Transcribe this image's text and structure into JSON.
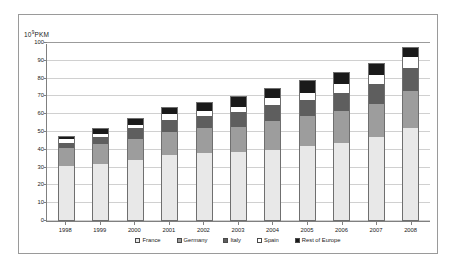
{
  "chart_data": {
    "type": "bar",
    "stacked": true,
    "title": "",
    "subtitle": "",
    "xlabel": "",
    "ylabel": "10⁹PKM",
    "ylabel_base": "10",
    "ylabel_exp": "9",
    "ylabel_unit": "PKM",
    "categories": [
      "1998",
      "1999",
      "2000",
      "2001",
      "2002",
      "2003",
      "2004",
      "2005",
      "2006",
      "2007",
      "2008"
    ],
    "series": [
      {
        "name": "France",
        "color": "#e8e8e8",
        "values": [
          31,
          32,
          34,
          37,
          38,
          39,
          40,
          42,
          44,
          47,
          52
        ]
      },
      {
        "name": "Germany",
        "color": "#9d9d9d",
        "values": [
          10,
          11,
          12,
          13,
          14,
          14,
          16,
          17,
          18,
          19,
          21
        ]
      },
      {
        "name": "Italy",
        "color": "#5e5e5e",
        "values": [
          3,
          4,
          6,
          7,
          7,
          8,
          9,
          9,
          10,
          11,
          13
        ]
      },
      {
        "name": "Spain",
        "color": "#ffffff",
        "values": [
          2,
          2,
          2,
          3,
          3,
          3,
          4,
          4,
          5,
          5,
          6
        ]
      },
      {
        "name": "Rest of Europe",
        "color": "#1a1a1a",
        "values": [
          2,
          3,
          4,
          4,
          5,
          6,
          6,
          7,
          7,
          7,
          6
        ]
      }
    ],
    "totals": [
      48,
      52,
      58,
      64,
      67,
      70,
      75,
      79,
      84,
      89,
      98
    ],
    "yticks": [
      0,
      10,
      20,
      30,
      40,
      50,
      60,
      70,
      80,
      90,
      100
    ],
    "ylim": [
      0,
      100
    ],
    "grid": true,
    "legend_position": "bottom"
  }
}
